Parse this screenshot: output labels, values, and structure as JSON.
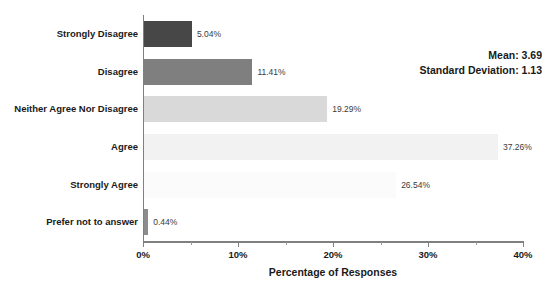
{
  "chart_data": {
    "type": "bar",
    "orientation": "horizontal",
    "title": "",
    "xlabel": "Percentage of Responses",
    "ylabel": "",
    "xlim": [
      0,
      40
    ],
    "xunit": "%",
    "grid": false,
    "legend": null,
    "categories": [
      "Strongly Disagree",
      "Disagree",
      "Neither Agree Nor Disagree",
      "Agree",
      "Strongly Agree",
      "Prefer not to answer"
    ],
    "values": [
      5.04,
      11.41,
      19.29,
      37.26,
      26.54,
      0.44
    ],
    "data_labels": [
      "5.04%",
      "11.41%",
      "19.29%",
      "37.26%",
      "26.54%",
      "0.44%"
    ],
    "bar_colors": [
      "#474747",
      "#7f7f7f",
      "#d9d9d9",
      "#f2f2f2",
      "#fbfbfb",
      "#8c8c8c"
    ],
    "xtick_values": [
      0,
      10,
      20,
      30,
      40
    ],
    "xtick_labels": [
      "0%",
      "10%",
      "20%",
      "30%",
      "40%"
    ],
    "xtick_minor_values": [
      5,
      15,
      25,
      35
    ],
    "annotations": [
      {
        "label": "Mean:",
        "value": "3.69",
        "text": "Mean: 3.69"
      },
      {
        "label": "Standard Deviation:",
        "value": "1.13",
        "text": "Standard Deviation: 1.13"
      }
    ]
  },
  "stats": {
    "mean_line": "Mean: 3.69",
    "sd_line": "Standard Deviation: 1.13"
  },
  "axis": {
    "x_title": "Percentage of Responses"
  }
}
